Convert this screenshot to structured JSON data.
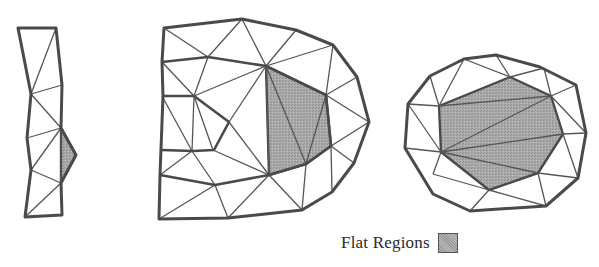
{
  "figure": {
    "colors": {
      "background": "#ffffff",
      "edge": "#555555",
      "boundary_edge": "#4a4a4a",
      "flat_fill": "#a9a9a9"
    },
    "meshes": [
      {
        "name": "strip-mesh",
        "boundary": [
          [
            18,
            28
          ],
          [
            56,
            28
          ],
          [
            62,
            85
          ],
          [
            61,
            128
          ],
          [
            76,
            155
          ],
          [
            61,
            183
          ],
          [
            62,
            215
          ],
          [
            25,
            217
          ],
          [
            31,
            170
          ],
          [
            27,
            138
          ],
          [
            31,
            94
          ]
        ],
        "flat_regions": [
          [
            [
              61,
              128
            ],
            [
              76,
              155
            ],
            [
              61,
              183
            ]
          ]
        ],
        "thick_edges": [],
        "edges": [
          [
            [
              56,
              28
            ],
            [
              31,
              94
            ]
          ],
          [
            [
              31,
              94
            ],
            [
              62,
              85
            ]
          ],
          [
            [
              31,
              94
            ],
            [
              61,
              128
            ]
          ],
          [
            [
              27,
              138
            ],
            [
              61,
              128
            ]
          ],
          [
            [
              31,
              170
            ],
            [
              61,
              128
            ]
          ],
          [
            [
              31,
              170
            ],
            [
              61,
              183
            ]
          ],
          [
            [
              61,
              128
            ],
            [
              61,
              183
            ]
          ],
          [
            [
              25,
              217
            ],
            [
              61,
              183
            ]
          ]
        ]
      },
      {
        "name": "d-mesh",
        "boundary": [
          [
            164,
            28
          ],
          [
            242,
            19
          ],
          [
            296,
            30
          ],
          [
            333,
            45
          ],
          [
            357,
            77
          ],
          [
            369,
            122
          ],
          [
            354,
            163
          ],
          [
            332,
            192
          ],
          [
            302,
            210
          ],
          [
            228,
            218
          ],
          [
            159,
            219
          ],
          [
            160,
            175
          ],
          [
            163,
            96
          ],
          [
            162,
            62
          ]
        ],
        "flat_regions": [
          [
            [
              266,
              66
            ],
            [
              326,
              95
            ],
            [
              331,
              146
            ],
            [
              306,
              164
            ],
            [
              269,
              175
            ]
          ]
        ],
        "thick_edges": [
          [
            [
              162,
              62
            ],
            [
              208,
              57
            ],
            [
              266,
              66
            ],
            [
              326,
              95
            ],
            [
              331,
              146
            ],
            [
              306,
              164
            ],
            [
              269,
              175
            ],
            [
              215,
              185
            ],
            [
              160,
              175
            ]
          ],
          [
            [
              162,
              96
            ],
            [
              194,
              96
            ],
            [
              229,
              122
            ],
            [
              214,
              150
            ],
            [
              193,
              151
            ],
            [
              162,
              150
            ]
          ]
        ],
        "edges": [
          [
            [
              164,
              28
            ],
            [
              208,
              57
            ]
          ],
          [
            [
              208,
              57
            ],
            [
              242,
              19
            ]
          ],
          [
            [
              242,
              19
            ],
            [
              266,
              66
            ]
          ],
          [
            [
              266,
              66
            ],
            [
              296,
              30
            ]
          ],
          [
            [
              266,
              66
            ],
            [
              333,
              45
            ]
          ],
          [
            [
              162,
              62
            ],
            [
              194,
              96
            ]
          ],
          [
            [
              208,
              57
            ],
            [
              194,
              96
            ]
          ],
          [
            [
              194,
              96
            ],
            [
              266,
              66
            ]
          ],
          [
            [
              229,
              122
            ],
            [
              266,
              66
            ]
          ],
          [
            [
              194,
              96
            ],
            [
              192,
              151
            ]
          ],
          [
            [
              194,
              96
            ],
            [
              213,
              150
            ]
          ],
          [
            [
              162,
              96
            ],
            [
              192,
              151
            ]
          ],
          [
            [
              229,
              122
            ],
            [
              269,
              175
            ]
          ],
          [
            [
              266,
              66
            ],
            [
              269,
              175
            ]
          ],
          [
            [
              266,
              66
            ],
            [
              306,
              164
            ]
          ],
          [
            [
              306,
              164
            ],
            [
              326,
              95
            ]
          ],
          [
            [
              326,
              95
            ],
            [
              333,
              45
            ]
          ],
          [
            [
              326,
              95
            ],
            [
              357,
              77
            ]
          ],
          [
            [
              326,
              95
            ],
            [
              369,
              122
            ]
          ],
          [
            [
              331,
              146
            ],
            [
              369,
              122
            ]
          ],
          [
            [
              331,
              146
            ],
            [
              354,
              163
            ]
          ],
          [
            [
              331,
              146
            ],
            [
              332,
              192
            ]
          ],
          [
            [
              306,
              164
            ],
            [
              302,
              210
            ]
          ],
          [
            [
              269,
              175
            ],
            [
              302,
              210
            ]
          ],
          [
            [
              269,
              175
            ],
            [
              228,
              218
            ]
          ],
          [
            [
              160,
              175
            ],
            [
              192,
              151
            ]
          ],
          [
            [
              192,
              151
            ],
            [
              215,
              185
            ]
          ],
          [
            [
              213,
              150
            ],
            [
              269,
              175
            ]
          ],
          [
            [
              215,
              185
            ],
            [
              159,
              219
            ]
          ],
          [
            [
              215,
              185
            ],
            [
              228,
              218
            ]
          ]
        ]
      },
      {
        "name": "octagon-mesh",
        "boundary": [
          [
            408,
            104
          ],
          [
            430,
            76
          ],
          [
            464,
            59
          ],
          [
            496,
            55
          ],
          [
            540,
            67
          ],
          [
            576,
            85
          ],
          [
            586,
            133
          ],
          [
            578,
            178
          ],
          [
            546,
            206
          ],
          [
            470,
            211
          ],
          [
            433,
            194
          ],
          [
            405,
            148
          ]
        ],
        "flat_regions": [
          [
            [
              439,
              106
            ],
            [
              510,
              77
            ],
            [
              551,
              96
            ],
            [
              563,
              134
            ],
            [
              538,
              173
            ],
            [
              489,
              190
            ],
            [
              441,
              152
            ]
          ]
        ],
        "thick_edges": [],
        "edges": [
          [
            [
              408,
              104
            ],
            [
              439,
              106
            ]
          ],
          [
            [
              430,
              76
            ],
            [
              439,
              106
            ]
          ],
          [
            [
              464,
              59
            ],
            [
              439,
              106
            ]
          ],
          [
            [
              464,
              59
            ],
            [
              510,
              77
            ]
          ],
          [
            [
              496,
              55
            ],
            [
              510,
              77
            ]
          ],
          [
            [
              510,
              77
            ],
            [
              544,
              68
            ]
          ],
          [
            [
              544,
              68
            ],
            [
              551,
              96
            ]
          ],
          [
            [
              551,
              96
            ],
            [
              576,
              85
            ]
          ],
          [
            [
              551,
              96
            ],
            [
              586,
              133
            ]
          ],
          [
            [
              563,
              134
            ],
            [
              586,
              133
            ]
          ],
          [
            [
              563,
              134
            ],
            [
              578,
              178
            ]
          ],
          [
            [
              538,
              173
            ],
            [
              578,
              178
            ]
          ],
          [
            [
              538,
              173
            ],
            [
              546,
              206
            ]
          ],
          [
            [
              489,
              190
            ],
            [
              546,
              206
            ]
          ],
          [
            [
              489,
              190
            ],
            [
              470,
              211
            ]
          ],
          [
            [
              433,
              174
            ],
            [
              489,
              190
            ]
          ],
          [
            [
              441,
              152
            ],
            [
              433,
              174
            ]
          ],
          [
            [
              441,
              152
            ],
            [
              405,
              148
            ]
          ],
          [
            [
              441,
              152
            ],
            [
              408,
              104
            ]
          ],
          [
            [
              441,
              152
            ],
            [
              551,
              96
            ]
          ],
          [
            [
              441,
              152
            ],
            [
              563,
              134
            ]
          ],
          [
            [
              441,
              152
            ],
            [
              538,
              173
            ]
          ],
          [
            [
              439,
              106
            ],
            [
              551,
              96
            ]
          ]
        ]
      }
    ],
    "legend": {
      "label": "Flat Regions"
    }
  }
}
